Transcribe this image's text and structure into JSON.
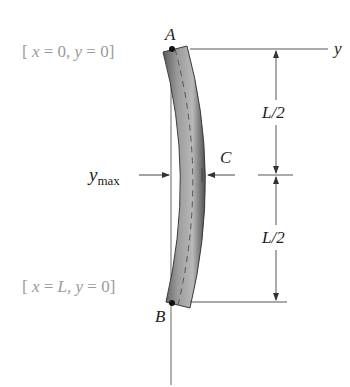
{
  "figure": {
    "type": "beam-deflection-diagram",
    "points": {
      "A": "A",
      "B": "B",
      "C": "C"
    },
    "axis_label": "y",
    "boundary_conditions": {
      "top": {
        "open": "[",
        "x_var": "x",
        "x_val": "0,",
        "y_var": "y",
        "y_val": "0",
        "close": "]",
        "eq": "="
      },
      "bottom": {
        "open": "[",
        "x_var": "x",
        "x_val": "L,",
        "y_var": "y",
        "y_val": "0",
        "close": "]",
        "eq": "="
      }
    },
    "dimensions": {
      "upper": "L/2",
      "lower": "L/2"
    },
    "max_deflection": {
      "symbol": "y",
      "subscript": "max"
    },
    "colors": {
      "beam_dark": "#4a4a4a",
      "beam_light": "#b5b5b5",
      "lines": "#555555",
      "condition_text": "#9a9a9a",
      "label_text": "#222222"
    }
  }
}
